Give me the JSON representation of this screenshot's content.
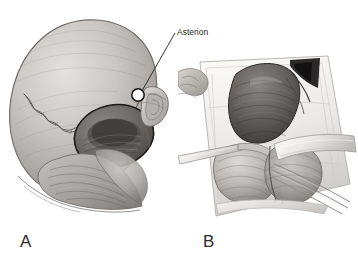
{
  "figure": {
    "type": "anatomical-illustration",
    "style": "grayscale pencil / graphite medical illustration",
    "background_color": "#ffffff",
    "panel_count": 2
  },
  "panels": [
    {
      "id": "A",
      "label": "A",
      "name": "skull-surface-anatomy-panel",
      "description": "Posterolateral view of the skull and head showing the cranial sutures, the mastoid region and the outline of a planned retrosigmoid craniotomy over the posterior fossa.",
      "annotations": [
        {
          "label": "Asterion",
          "marker": "white-circle",
          "marker_position": {
            "x": 138,
            "y": 95
          },
          "text_position": {
            "x": 177,
            "y": 27
          },
          "leader_line": {
            "x1": 175,
            "y1": 34,
            "x2": 142,
            "y2": 90
          }
        }
      ]
    },
    {
      "id": "B",
      "label": "B",
      "name": "surgical-exposure-panel",
      "description": "Intraoperative surgical exposure through the craniotomy with retracted drapes, dural flap and underlying cerebellum with retractor blades in place.",
      "annotations": []
    }
  ],
  "callout": {
    "asterion_label": "Asterion"
  },
  "labels": {
    "panel_a": "A",
    "panel_b": "B"
  },
  "signature": {
    "present": true,
    "legible": false,
    "description": "artist cursive signature at lower edge of panel B"
  },
  "colors": {
    "background": "#ffffff",
    "ink": "#1f1f1f",
    "label_text": "#2b2b2b",
    "bone_light": "#d8d6d3",
    "bone_mid": "#b6b3b0",
    "bone_shadow": "#8f8c8a",
    "deep_shadow": "#4a4846",
    "tissue_dark": "#6d6a68",
    "drape_light": "#f2f1f0",
    "marker_fill": "#ffffff",
    "marker_stroke": "#1a1a1a"
  }
}
